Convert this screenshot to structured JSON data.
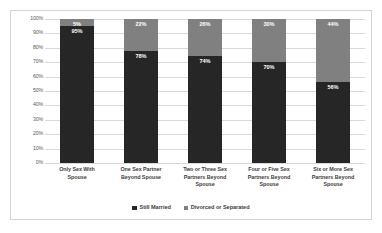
{
  "chart_data": {
    "type": "bar",
    "subtype": "stacked-bar-100",
    "title": "",
    "xlabel": "",
    "ylabel": "",
    "ylim": [
      0,
      100
    ],
    "grid": true,
    "legend_position": "bottom",
    "categories": [
      "Only Sex With Spouse",
      "One Sex Partner Beyond Spouse",
      "Two or Three Sex Partners Beyond Spouse",
      "Four or Five Sex Partners Beyond Spouse",
      "Six or More Sex Partners Beyond Spouse"
    ],
    "series": [
      {
        "name": "Still Married",
        "color": "#262626",
        "values": [
          95,
          78,
          74,
          70,
          56
        ],
        "labels": [
          "95%",
          "78%",
          "74%",
          "70%",
          "56%"
        ]
      },
      {
        "name": "Divorced or Separated",
        "color": "#808080",
        "values": [
          5,
          22,
          26,
          30,
          44
        ],
        "labels": [
          "5%",
          "22%",
          "26%",
          "30%",
          "44%"
        ]
      }
    ],
    "y_ticks": [
      "100%",
      "90%",
      "80%",
      "70%",
      "60%",
      "50%",
      "40%",
      "30%",
      "20%",
      "10%",
      "0%"
    ],
    "y_tick_values": [
      100,
      90,
      80,
      70,
      60,
      50,
      40,
      30,
      20,
      10,
      0
    ]
  },
  "axis": {
    "y_ticks": [
      {
        "label": "100%",
        "value": 100
      },
      {
        "label": "90%",
        "value": 90
      },
      {
        "label": "80%",
        "value": 80
      },
      {
        "label": "70%",
        "value": 70
      },
      {
        "label": "60%",
        "value": 60
      },
      {
        "label": "50%",
        "value": 50
      },
      {
        "label": "40%",
        "value": 40
      },
      {
        "label": "30%",
        "value": 30
      },
      {
        "label": "20%",
        "value": 20
      },
      {
        "label": "10%",
        "value": 10
      },
      {
        "label": "0%",
        "value": 0
      }
    ]
  },
  "categories": [
    {
      "lines": [
        "Only Sex With",
        "Spouse"
      ]
    },
    {
      "lines": [
        "One Sex Partner",
        "Beyond Spouse"
      ]
    },
    {
      "lines": [
        "Two or Three Sex",
        "Partners Beyond",
        "Spouse"
      ]
    },
    {
      "lines": [
        "Four or Five Sex",
        "Partners Beyond",
        "Spouse"
      ]
    },
    {
      "lines": [
        "Six or More Sex",
        "Partners Beyond",
        "Spouse"
      ]
    }
  ],
  "legend": {
    "items": [
      {
        "label": "Still Married",
        "color": "#262626"
      },
      {
        "label": "Divorced or Separated",
        "color": "#808080"
      }
    ]
  },
  "colors": {
    "still_married": "#262626",
    "divorced_or_separated": "#808080",
    "gridline": "#d9d9d9",
    "border": "#d4d4d4",
    "axis_text": "#595959",
    "label_text": "#404040",
    "data_label_text": "#ffffff",
    "background": "#ffffff"
  }
}
